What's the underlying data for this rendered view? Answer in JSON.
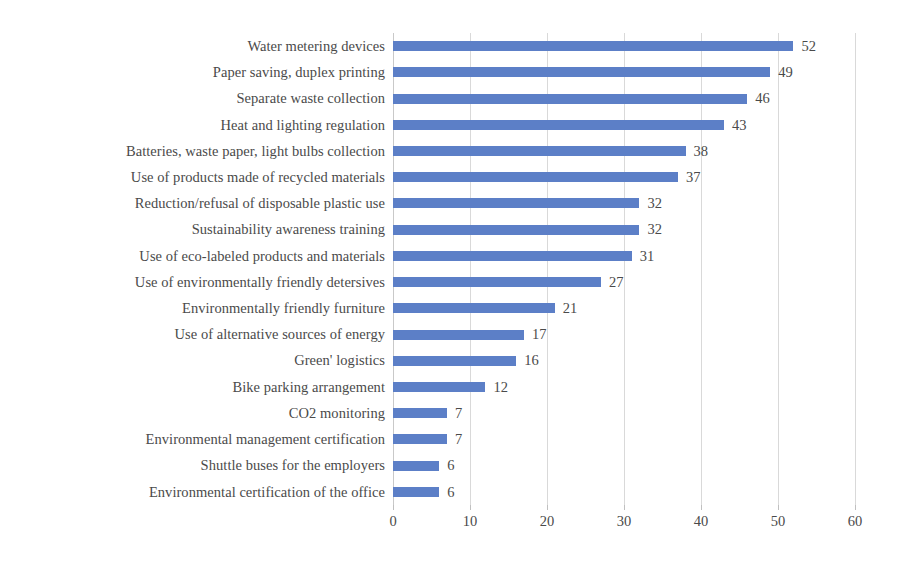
{
  "chart_data": {
    "type": "bar",
    "orientation": "horizontal",
    "title": "",
    "subtitle": "",
    "xlabel": "",
    "ylabel": "",
    "xlim": [
      0,
      60
    ],
    "xticks": [
      0,
      10,
      20,
      30,
      40,
      50,
      60
    ],
    "grid": "vertical",
    "legend": "none",
    "data_labels": true,
    "bar_color": "#5c7fc7",
    "text_color": "#4a4a4a",
    "gridline_color": "#d9d9d9",
    "categories": [
      "Water metering devices",
      "Paper saving, duplex printing",
      "Separate waste collection",
      "Heat and lighting regulation",
      "Batteries, waste paper, light bulbs collection",
      "Use of products made of recycled materials",
      "Reduction/refusal of disposable plastic use",
      "Sustainability awareness training",
      "Use of eco-labeled products and materials",
      "Use of environmentally friendly detersives",
      "Environmentally friendly furniture",
      "Use of alternative sources of energy",
      "Green' logistics",
      "Bike parking arrangement",
      "CO2 monitoring",
      "Environmental management certification",
      "Shuttle buses for the employers",
      "Environmental certification of the office"
    ],
    "values": [
      52,
      49,
      46,
      43,
      38,
      37,
      32,
      32,
      31,
      27,
      21,
      17,
      16,
      12,
      7,
      7,
      6,
      6
    ]
  }
}
